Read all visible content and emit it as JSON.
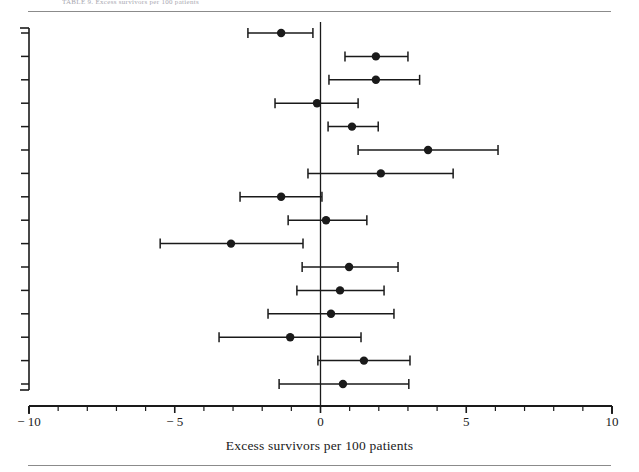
{
  "figure": {
    "top_caption": "TABLE 9. Excess survivors per 100 patients",
    "xlabel": "Excess survivors per 100 patients"
  },
  "chart_data": {
    "type": "scatter",
    "subtype": "forest-plot",
    "title": "",
    "xlabel": "Excess survivors per 100 patients",
    "ylabel": "",
    "xlim": [
      -10,
      10
    ],
    "xticks": [
      -10,
      -5,
      0,
      5,
      10
    ],
    "xtick_labels": [
      "− 10",
      "− 5",
      "0",
      "5",
      "10"
    ],
    "xminor_tick_step": 1,
    "grid": false,
    "legend": null,
    "reference_line_x": 0,
    "n_studies": 16,
    "series": [
      {
        "name": "study-1",
        "estimate": -1.35,
        "ci_low": -2.49,
        "ci_high": -0.26
      },
      {
        "name": "study-2",
        "estimate": 1.9,
        "ci_low": 0.84,
        "ci_high": 3.0
      },
      {
        "name": "study-3",
        "estimate": 1.9,
        "ci_low": 0.29,
        "ci_high": 3.4
      },
      {
        "name": "study-4",
        "estimate": -0.12,
        "ci_low": -1.56,
        "ci_high": 1.29
      },
      {
        "name": "study-5",
        "estimate": 1.08,
        "ci_low": 0.26,
        "ci_high": 1.98
      },
      {
        "name": "study-6",
        "estimate": 3.69,
        "ci_low": 1.29,
        "ci_high": 6.09
      },
      {
        "name": "study-7",
        "estimate": 2.07,
        "ci_low": -0.43,
        "ci_high": 4.55
      },
      {
        "name": "study-8",
        "estimate": -1.35,
        "ci_low": -2.76,
        "ci_high": 0.05
      },
      {
        "name": "study-9",
        "estimate": 0.19,
        "ci_low": -1.11,
        "ci_high": 1.59
      },
      {
        "name": "study-10",
        "estimate": -3.07,
        "ci_low": -5.5,
        "ci_high": -0.6
      },
      {
        "name": "study-11",
        "estimate": 0.98,
        "ci_low": -0.63,
        "ci_high": 2.66
      },
      {
        "name": "study-12",
        "estimate": 0.67,
        "ci_low": -0.81,
        "ci_high": 2.18
      },
      {
        "name": "study-13",
        "estimate": 0.36,
        "ci_low": -1.8,
        "ci_high": 2.52
      },
      {
        "name": "study-14",
        "estimate": -1.04,
        "ci_low": -3.48,
        "ci_high": 1.39
      },
      {
        "name": "study-15",
        "estimate": 1.49,
        "ci_low": -0.09,
        "ci_high": 3.07
      },
      {
        "name": "study-16",
        "estimate": 0.77,
        "ci_low": -1.42,
        "ci_high": 3.03
      }
    ]
  },
  "style": {
    "ink": "#1a1a1a",
    "rule": "#8b8b8b",
    "paper": "#ffffff"
  }
}
